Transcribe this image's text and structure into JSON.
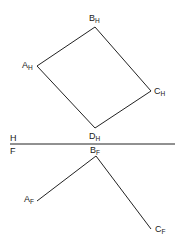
{
  "diagram": {
    "type": "descriptive-geometry-projection",
    "colors": {
      "line": "#222222",
      "text": "#1a1a1a",
      "background": "#ffffff"
    },
    "fold_line": {
      "top_label": "H",
      "bottom_label": "F",
      "y": 144,
      "x1": 10,
      "x2": 175
    },
    "horizontal_view": {
      "points": [
        {
          "name": "A",
          "sub": "H",
          "x": 37,
          "y": 66,
          "lx": 22,
          "ly": 68
        },
        {
          "name": "B",
          "sub": "H",
          "x": 95,
          "y": 27,
          "lx": 89,
          "ly": 21
        },
        {
          "name": "C",
          "sub": "H",
          "x": 151,
          "y": 91,
          "lx": 154,
          "ly": 94
        },
        {
          "name": "D",
          "sub": "H",
          "x": 95,
          "y": 128,
          "lx": 89,
          "ly": 139
        }
      ],
      "edges": [
        [
          "A",
          "B"
        ],
        [
          "B",
          "C"
        ],
        [
          "C",
          "D"
        ],
        [
          "D",
          "A"
        ]
      ]
    },
    "frontal_view": {
      "points": [
        {
          "name": "A",
          "sub": "F",
          "x": 37,
          "y": 201,
          "lx": 24,
          "ly": 202
        },
        {
          "name": "B",
          "sub": "F",
          "x": 96,
          "y": 156,
          "lx": 90,
          "ly": 153
        },
        {
          "name": "C",
          "sub": "F",
          "x": 151,
          "y": 229,
          "lx": 155,
          "ly": 232
        }
      ],
      "edges": [
        [
          "A",
          "B"
        ],
        [
          "B",
          "C"
        ]
      ]
    }
  }
}
